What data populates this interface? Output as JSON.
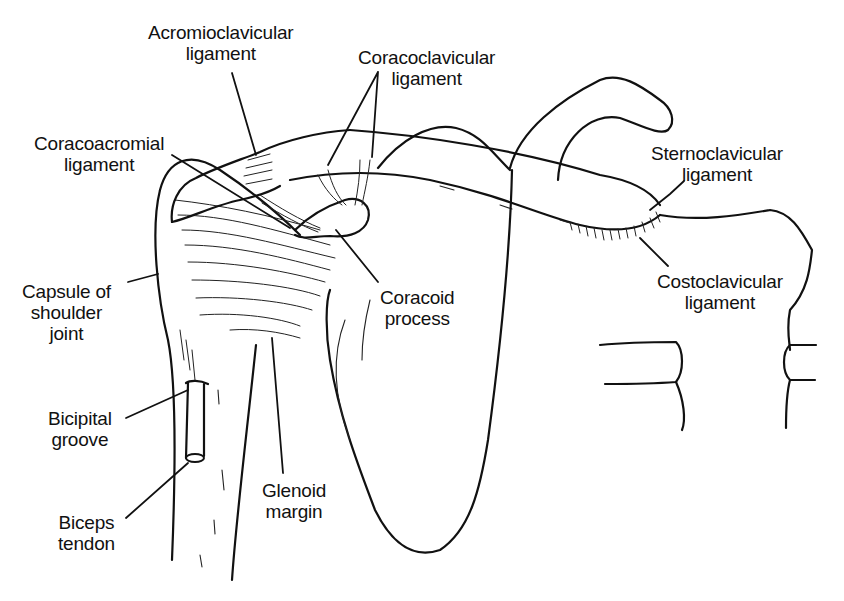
{
  "figure": {
    "line_color": "#111111",
    "background": "#ffffff"
  },
  "labels": {
    "acromioclavicular": {
      "line1": "Acromioclavicular",
      "line2": "ligament"
    },
    "coracoclavicular": {
      "line1": "Coracoclavicular",
      "line2": "ligament"
    },
    "coracoacromial": {
      "line1": "Coracoacromial",
      "line2": "ligament"
    },
    "sternoclavicular": {
      "line1": "Sternoclavicular",
      "line2": "ligament"
    },
    "capsule": {
      "line1": "Capsule of",
      "line2": "shoulder",
      "line3": "joint"
    },
    "coracoid": {
      "line1": "Coracoid",
      "line2": "process"
    },
    "costoclavicular": {
      "line1": "Costoclavicular",
      "line2": "ligament"
    },
    "bicipital_groove": {
      "line1": "Bicipital",
      "line2": "groove"
    },
    "glenoid_margin": {
      "line1": "Glenoid",
      "line2": "margin"
    },
    "biceps_tendon": {
      "line1": "Biceps",
      "line2": "tendon"
    }
  }
}
